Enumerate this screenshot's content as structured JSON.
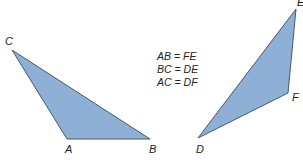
{
  "diagram": {
    "fill_color": "#8fb0d6",
    "stroke_color": "#4a5866",
    "triangle_abc": {
      "vertices": {
        "A": [
          67,
          139
        ],
        "B": [
          150,
          139
        ],
        "C": [
          12,
          50
        ]
      },
      "labels": {
        "A": "A",
        "B": "B",
        "C": "C"
      }
    },
    "triangle_def": {
      "vertices": {
        "D": [
          198,
          138
        ],
        "E": [
          296,
          9
        ],
        "F": [
          288,
          93
        ]
      },
      "labels": {
        "D": "D",
        "E": "E",
        "F": "F"
      }
    },
    "equalities": [
      "AB = FE",
      "BC = DE",
      "AC = DF"
    ]
  }
}
